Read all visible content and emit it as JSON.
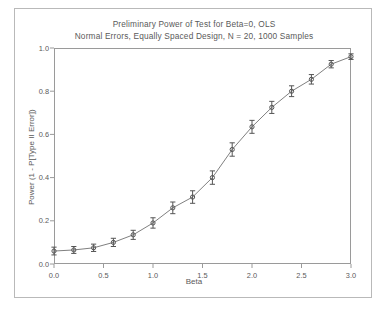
{
  "chart_data": {
    "type": "line",
    "title": "Preliminary Power of Test for Beta=0, OLS",
    "subtitle": "Normal Errors, Equally Spaced Design, N = 20, 1000 Samples",
    "xlabel": "Beta",
    "ylabel": "Power (1 - P[Type II Error])",
    "xlim": [
      0.0,
      3.0
    ],
    "ylim": [
      0.0,
      1.0
    ],
    "xticks": [
      "0.0",
      "0.5",
      "1.0",
      "1.5",
      "2.0",
      "2.5",
      "3.0"
    ],
    "xtick_values": [
      0.0,
      0.5,
      1.0,
      1.5,
      2.0,
      2.5,
      3.0
    ],
    "yticks": [
      "0.0",
      "0.2",
      "0.4",
      "0.6",
      "0.8",
      "1.0"
    ],
    "ytick_values": [
      0.0,
      0.2,
      0.4,
      0.6,
      0.8,
      1.0
    ],
    "grid": false,
    "legend": "none",
    "marker": "open-circle",
    "error_bars": "vertical",
    "x": [
      0.0,
      0.2,
      0.4,
      0.6,
      0.8,
      1.0,
      1.2,
      1.4,
      1.6,
      1.8,
      2.0,
      2.2,
      2.4,
      2.6,
      2.8,
      3.0
    ],
    "values": [
      0.06,
      0.065,
      0.075,
      0.1,
      0.135,
      0.19,
      0.26,
      0.31,
      0.4,
      0.53,
      0.635,
      0.725,
      0.8,
      0.855,
      0.925,
      0.96
    ],
    "errors": [
      0.018,
      0.016,
      0.017,
      0.019,
      0.021,
      0.024,
      0.027,
      0.029,
      0.031,
      0.031,
      0.03,
      0.028,
      0.025,
      0.022,
      0.017,
      0.013
    ],
    "line_color": "#808080",
    "marker_color": "#555555"
  },
  "colors": {
    "background": "#ffffff",
    "border": "#b9b9b9",
    "axis": "#9a9a9a",
    "text": "#5a5a5a"
  }
}
